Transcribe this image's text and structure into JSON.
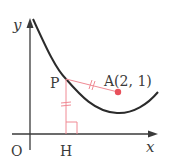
{
  "diagram": {
    "axes": {
      "x_label": "x",
      "y_label": "y",
      "origin_label": "O"
    },
    "points": {
      "P": {
        "label": "P"
      },
      "A": {
        "label": "A(2, 1)"
      },
      "H": {
        "label": "H"
      }
    },
    "colors": {
      "curve": "#2b2b2b",
      "axis": "#3a3a3a",
      "accent": "#e8505b",
      "construction": "#f08a94"
    }
  }
}
